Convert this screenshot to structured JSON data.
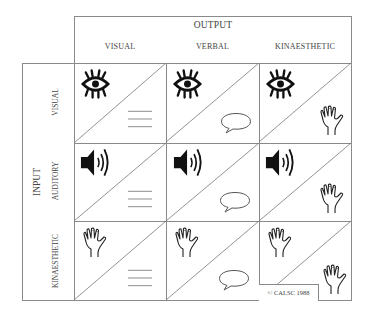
{
  "header": {
    "output_title": "OUTPUT",
    "columns": [
      "VISUAL",
      "VERBAL",
      "KINAESTHETIC"
    ]
  },
  "side": {
    "input_title": "INPUT",
    "rows": [
      "VISUAL",
      "AUDITORY",
      "KINAESTHETIC"
    ]
  },
  "cells": [
    {
      "row": "VISUAL",
      "col": "VISUAL",
      "input_icon": "eye-icon",
      "output_icon": "lines-icon"
    },
    {
      "row": "VISUAL",
      "col": "VERBAL",
      "input_icon": "eye-icon",
      "output_icon": "speech-bubble-icon"
    },
    {
      "row": "VISUAL",
      "col": "KINAESTHETIC",
      "input_icon": "eye-icon",
      "output_icon": "hand-icon"
    },
    {
      "row": "AUDITORY",
      "col": "VISUAL",
      "input_icon": "speaker-icon",
      "output_icon": "lines-icon"
    },
    {
      "row": "AUDITORY",
      "col": "VERBAL",
      "input_icon": "speaker-icon",
      "output_icon": "speech-bubble-icon"
    },
    {
      "row": "AUDITORY",
      "col": "KINAESTHETIC",
      "input_icon": "speaker-icon",
      "output_icon": "hand-icon"
    },
    {
      "row": "KINAESTHETIC",
      "col": "VISUAL",
      "input_icon": "hand-icon",
      "output_icon": "lines-icon"
    },
    {
      "row": "KINAESTHETIC",
      "col": "VERBAL",
      "input_icon": "hand-icon",
      "output_icon": "speech-bubble-icon"
    },
    {
      "row": "KINAESTHETIC",
      "col": "KINAESTHETIC",
      "input_icon": "hand-icon",
      "output_icon": "hand-icon"
    }
  ],
  "copyright": "© CALSC 1988",
  "colors": {
    "lines": "#8a8a8a",
    "ink": "#111111",
    "text": "#444444"
  }
}
